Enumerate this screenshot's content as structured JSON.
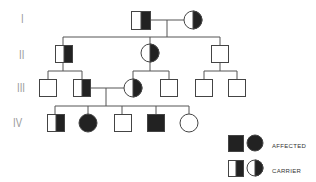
{
  "generations": [
    {
      "label": "I",
      "y": 20
    },
    {
      "label": "II",
      "y": 56
    },
    {
      "label": "III",
      "y": 89
    },
    {
      "label": "IV",
      "y": 124
    }
  ],
  "legend": {
    "affected_label": "AFFECTED",
    "carrier_label": "CARRIER"
  },
  "colors": {
    "line": "#555555",
    "fill": "#222222"
  }
}
